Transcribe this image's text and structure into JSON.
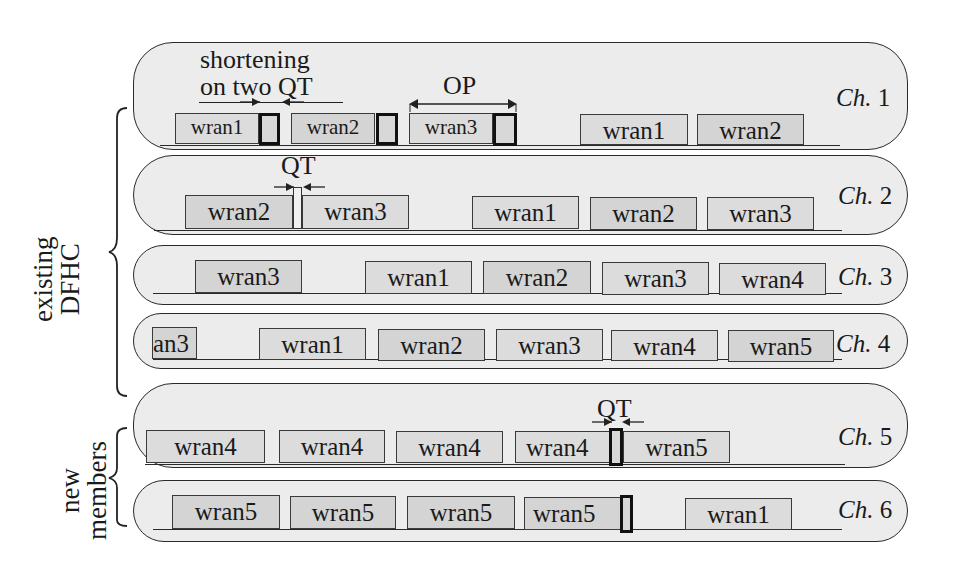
{
  "groups": {
    "existing": {
      "line1": "existing",
      "line2": "DFHC"
    },
    "new": {
      "line1": "new",
      "line2": "members"
    }
  },
  "annotations": {
    "shortening_line1": "shortening",
    "shortening_line2": "on two QT",
    "op": "OP",
    "qt": "QT"
  },
  "channels": [
    {
      "label_prefix": "Ch.",
      "number": "1",
      "slots": [
        "wran1",
        "wran2",
        "wran3",
        "wran1",
        "wran2"
      ]
    },
    {
      "label_prefix": "Ch.",
      "number": "2",
      "slots": [
        "wran2",
        "wran3",
        "wran1",
        "wran2",
        "wran3"
      ]
    },
    {
      "label_prefix": "Ch.",
      "number": "3",
      "slots": [
        "wran3",
        "wran1",
        "wran2",
        "wran3",
        "wran4"
      ]
    },
    {
      "label_prefix": "Ch.",
      "number": "4",
      "slots": [
        "an3",
        "wran1",
        "wran2",
        "wran3",
        "wran4",
        "wran5"
      ]
    },
    {
      "label_prefix": "Ch.",
      "number": "5",
      "slots": [
        "wran4",
        "wran4",
        "wran4",
        "wran4",
        "wran5"
      ]
    },
    {
      "label_prefix": "Ch.",
      "number": "6",
      "slots": [
        "wran5",
        "wran5",
        "wran5",
        "wran5",
        "wran1"
      ]
    }
  ],
  "colors": {
    "lane_fill": "#ececec",
    "box_fill": "#d4d4d4",
    "outline": "#2a2a2a"
  }
}
